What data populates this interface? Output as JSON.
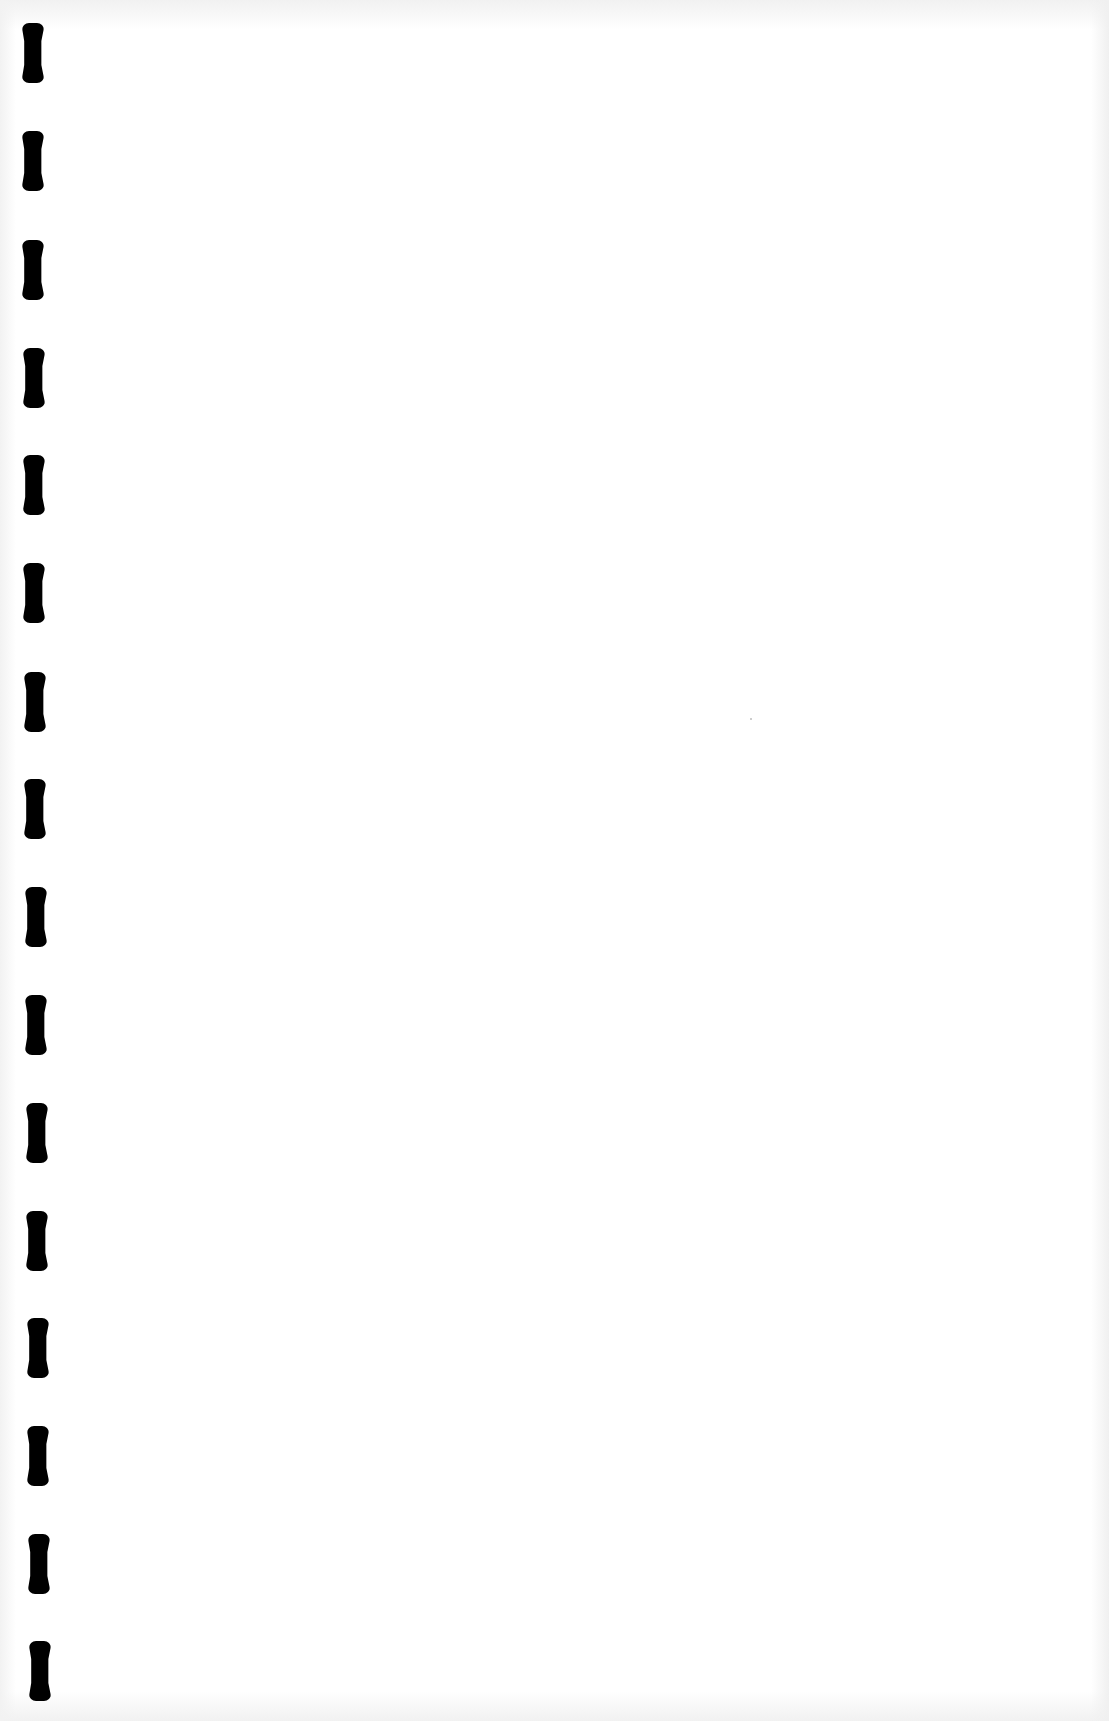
{
  "page": {
    "type": "scanned-blank-page",
    "background_color": "#ffffff",
    "text": "",
    "binding_holes": {
      "count": 16,
      "color": "#000000",
      "positions": [
        {
          "x": 22,
          "y": 23
        },
        {
          "x": 22,
          "y": 131
        },
        {
          "x": 22,
          "y": 240
        },
        {
          "x": 23,
          "y": 348
        },
        {
          "x": 23,
          "y": 455
        },
        {
          "x": 23,
          "y": 563
        },
        {
          "x": 24,
          "y": 672
        },
        {
          "x": 24,
          "y": 779
        },
        {
          "x": 25,
          "y": 887
        },
        {
          "x": 25,
          "y": 995
        },
        {
          "x": 26,
          "y": 1103
        },
        {
          "x": 26,
          "y": 1211
        },
        {
          "x": 27,
          "y": 1318
        },
        {
          "x": 27,
          "y": 1426
        },
        {
          "x": 28,
          "y": 1534
        },
        {
          "x": 29,
          "y": 1641
        }
      ]
    }
  }
}
